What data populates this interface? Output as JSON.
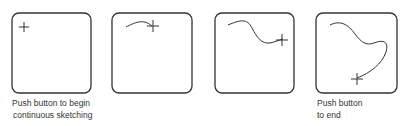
{
  "diagram": {
    "stroke_color": "#333333",
    "panels": [
      {
        "id": 1,
        "state": "cursor at start",
        "caption_line1": "Push button to begin",
        "caption_line2": "continuous sketching"
      },
      {
        "id": 2,
        "state": "short stroke drawn",
        "caption_line1": "",
        "caption_line2": ""
      },
      {
        "id": 3,
        "state": "longer wavy stroke",
        "caption_line1": "",
        "caption_line2": ""
      },
      {
        "id": 4,
        "state": "completed curve",
        "caption_line1": "Push button",
        "caption_line2": "to end"
      }
    ]
  }
}
